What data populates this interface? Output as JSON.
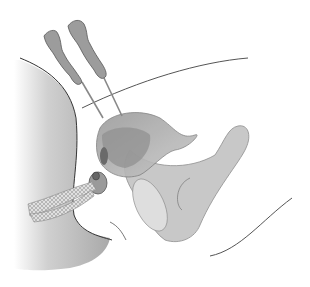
{
  "illustration": {
    "subject": "anatomical cross-section with two needle instruments",
    "colors": {
      "background": "#ffffff",
      "body_shade": "#bcbcbc",
      "organ_mid": "#a8a8a8",
      "organ_dark": "#7a7a7a",
      "pelvis_bone": "#c4c4c4",
      "outline": "#555555",
      "handle": "#9a9a9a",
      "mesh": "#d8d8d8"
    },
    "elements": [
      "needle-handle-left",
      "needle-handle-right",
      "needle-shaft-left",
      "needle-shaft-right",
      "body-torso-silhouette",
      "bladder-organ",
      "pelvic-bone",
      "mesh-sling",
      "urethral-opening",
      "abdominal-contour-line",
      "lower-contour-line"
    ]
  }
}
